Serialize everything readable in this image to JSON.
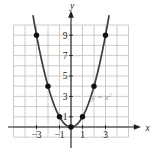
{
  "figure": {
    "background": "#ffffff",
    "description_of_plot": "Graph of the parabola y = x squared on a grid with plotted integer points"
  },
  "chart_data": {
    "type": "line",
    "title": "",
    "equation_label": "y = x",
    "equation_exponent": "2",
    "xlabel": "x",
    "ylabel": "y",
    "x_tick_labels": [
      "−3",
      "−1",
      "1",
      "3"
    ],
    "x_tick_values": [
      -3,
      -1,
      1,
      3
    ],
    "y_tick_labels": [
      "9",
      "7",
      "5",
      "3",
      "1"
    ],
    "y_tick_values": [
      9,
      7,
      5,
      3,
      1
    ],
    "points": [
      [
        -3,
        9
      ],
      [
        -2,
        4
      ],
      [
        -1,
        1
      ],
      [
        0,
        0
      ],
      [
        1,
        1
      ],
      [
        2,
        4
      ],
      [
        3,
        9
      ]
    ],
    "xlim": [
      -5,
      5
    ],
    "ylim": [
      -1,
      10
    ],
    "grid": true,
    "legend": "none",
    "curve_x_range": [
      -3.3,
      3.3
    ],
    "colors": {
      "grid": "#c9c6bf",
      "axis": "#1c1c1c",
      "curve": "#3d3d3d",
      "point": "#101010",
      "tick_label": "#222222",
      "equation": "#9b9b97"
    }
  }
}
